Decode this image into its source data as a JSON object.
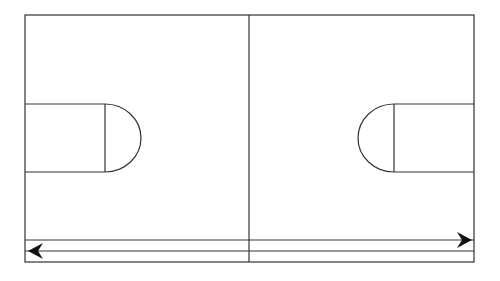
{
  "diagram": {
    "type": "basketball-court-layout",
    "colors": {
      "background": "#ffffff",
      "line": "#333333",
      "arrow": "#111111"
    },
    "court": {
      "x": 25,
      "y": 15,
      "width": 449,
      "height": 247
    },
    "center_line_x": 249,
    "lanes": {
      "upper_line_y": 240,
      "lower_line_y": 251
    },
    "left_key": {
      "top": 104,
      "bottom": 172,
      "free_throw_x": 105,
      "arc_radius": 34
    },
    "right_key": {
      "top": 104,
      "bottom": 172,
      "free_throw_x": 394,
      "arc_radius": 34
    },
    "arrows": [
      {
        "name": "left-arrow",
        "direction": "left",
        "tip_x": 28,
        "y": 251
      },
      {
        "name": "right-arrow",
        "direction": "right",
        "tip_x": 472,
        "y": 240
      }
    ]
  }
}
